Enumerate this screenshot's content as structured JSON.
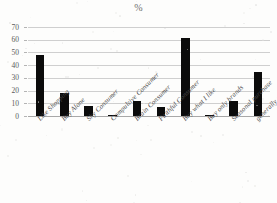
{
  "chart_data": {
    "type": "bar",
    "title": "%",
    "xlabel": "",
    "ylabel": "",
    "ylim": [
      0,
      70
    ],
    "ytick_step": 10,
    "yticks": [
      70,
      60,
      50,
      40,
      30,
      20,
      10,
      0
    ],
    "grid": true,
    "legend": false,
    "bar_color": "#0b0b0b",
    "categories": [
      "Like Shopping",
      "Buy Alone",
      "Shy Consumer",
      "Compulsive Consumer",
      "Brain Consumer",
      "Faithful Consumer",
      "Buy what I like",
      "Buy only brands",
      "Seasonal purchase",
      "generally satisfied"
    ],
    "values": [
      48,
      18,
      8,
      1,
      12,
      7,
      61,
      1,
      12,
      35
    ]
  },
  "colors": {
    "bar": "#0b0b0b",
    "grid": "#cfcfcf",
    "axis": "#a8a8a8",
    "text": "#4a4a4a",
    "background": "#fdfdfc"
  }
}
